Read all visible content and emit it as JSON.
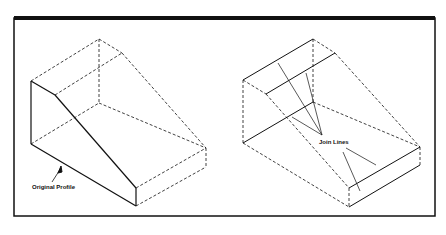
{
  "figure": {
    "left_panel": {
      "label": "Original Profile"
    },
    "right_panel": {
      "label": "Join Lines"
    }
  }
}
